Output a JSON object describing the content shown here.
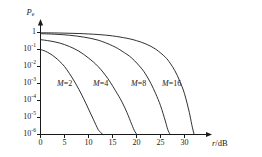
{
  "chart_data": {
    "type": "line",
    "title": "",
    "xlabel": "r/dB",
    "ylabel": "Pe",
    "ylabel_base": "P",
    "ylabel_sub": "e",
    "xlim": [
      0,
      35
    ],
    "ylim_exp": [
      -6,
      0.15
    ],
    "grid": false,
    "legend": "inline-curve-labels",
    "xticks": [
      "0",
      "5",
      "10",
      "15",
      "20",
      "25",
      "30"
    ],
    "xtick_values": [
      0,
      5,
      10,
      15,
      20,
      25,
      30
    ],
    "yticks": [
      {
        "mantissa": "1",
        "exp": ""
      },
      {
        "mantissa": "10",
        "exp": "-1"
      },
      {
        "mantissa": "10",
        "exp": "-2"
      },
      {
        "mantissa": "10",
        "exp": "-3"
      },
      {
        "mantissa": "10",
        "exp": "-4"
      },
      {
        "mantissa": "10",
        "exp": "-5"
      },
      {
        "mantissa": "10",
        "exp": "-6"
      }
    ],
    "ytick_exponents": [
      0,
      -1,
      -2,
      -3,
      -4,
      -5,
      -6
    ],
    "series": [
      {
        "name": "M=2",
        "label": "M=2",
        "label_var": "M",
        "label_rest": "=2",
        "color": "#1a1a1a",
        "x": [
          0,
          1,
          2,
          3,
          4,
          5,
          6,
          7,
          8,
          9,
          10,
          11,
          12,
          12.6,
          13.0
        ],
        "y_exp": [
          -1.0,
          -1.1,
          -1.25,
          -1.45,
          -1.7,
          -2.0,
          -2.4,
          -2.85,
          -3.35,
          -3.9,
          -4.5,
          -5.1,
          -5.7,
          -5.9,
          -6.0
        ]
      },
      {
        "name": "M=4",
        "label": "M=4",
        "label_var": "M",
        "label_rest": "=4",
        "color": "#1a1a1a",
        "x": [
          0,
          2,
          4,
          6,
          8,
          10,
          12,
          14,
          16,
          17,
          18,
          19,
          19.6,
          20.1
        ],
        "y_exp": [
          -0.42,
          -0.5,
          -0.62,
          -0.82,
          -1.1,
          -1.5,
          -2.0,
          -2.7,
          -3.6,
          -4.1,
          -4.7,
          -5.4,
          -5.8,
          -6.0
        ]
      },
      {
        "name": "M=8",
        "label": "M=8",
        "label_var": "M",
        "label_rest": "=8",
        "color": "#1a1a1a",
        "x": [
          0,
          3,
          6,
          9,
          12,
          15,
          17,
          19,
          21,
          22,
          23,
          24,
          25,
          26,
          26.5,
          27.0
        ],
        "y_exp": [
          -0.07,
          -0.1,
          -0.16,
          -0.27,
          -0.45,
          -0.78,
          -1.1,
          -1.5,
          -2.1,
          -2.5,
          -3.0,
          -3.6,
          -4.3,
          -5.2,
          -5.7,
          -6.0
        ]
      },
      {
        "name": "M=16",
        "label": "M=16",
        "label_var": "M",
        "label_rest": "=16",
        "color": "#1a1a1a",
        "x": [
          0,
          4,
          8,
          12,
          15,
          18,
          20,
          22,
          24,
          26,
          27,
          28,
          29,
          30,
          31,
          31.5,
          32.0
        ],
        "y_exp": [
          -0.015,
          -0.03,
          -0.06,
          -0.12,
          -0.2,
          -0.34,
          -0.48,
          -0.68,
          -0.98,
          -1.45,
          -1.8,
          -2.25,
          -2.85,
          -3.6,
          -4.7,
          -5.4,
          -6.0
        ]
      }
    ]
  }
}
